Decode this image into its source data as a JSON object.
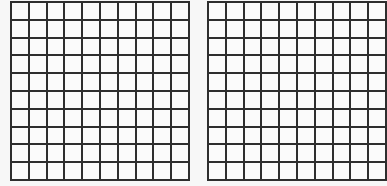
{
  "figure": {
    "grids": [
      {
        "id": "left-grid",
        "rows": 10,
        "cols": 10,
        "left": 10,
        "cell_size": 17.8
      },
      {
        "id": "right-grid",
        "rows": 10,
        "cols": 10,
        "left": 207,
        "cell_size": 17.8
      }
    ],
    "line_color": "#2e2e2e",
    "background_color": "#f7f7f7"
  }
}
